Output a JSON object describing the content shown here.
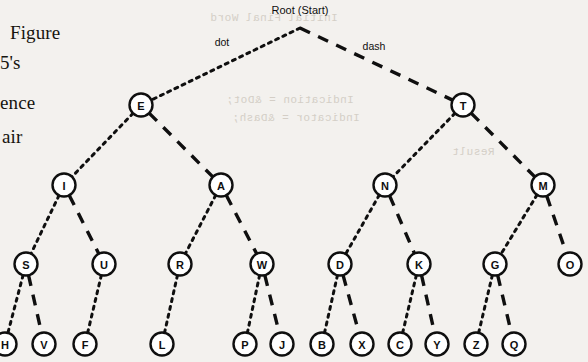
{
  "page": {
    "background": "#f3f1ee",
    "ink": "#0f0f0f",
    "ghost_ink": "#cfc9c0",
    "width": 588,
    "height": 362
  },
  "body_text_column": {
    "lines": [
      "Figure",
      "5's",
      "ence",
      "air"
    ],
    "note_clipped": "left column of page text, cropped by image edge"
  },
  "ghost_text": {
    "lines": [
      "Initial Final Word",
      "Indication = &Dot;",
      "Indicator = &Dash;",
      "Result"
    ]
  },
  "diagram": {
    "title": "Root (Start)",
    "edge_labels": {
      "left": "dot",
      "right": "dash"
    },
    "legend": {
      "dot_style": "dotted",
      "dash_style": "dashed",
      "dot_side": "left",
      "dash_side": "right"
    },
    "root": {
      "x": 300,
      "y": 28
    },
    "node_radius": 11.5,
    "nodes": [
      {
        "id": "E",
        "label": "E",
        "x": 141,
        "y": 105,
        "level": 1,
        "parent": "ROOT",
        "branch": "dot"
      },
      {
        "id": "T",
        "label": "T",
        "x": 463,
        "y": 105,
        "level": 1,
        "parent": "ROOT",
        "branch": "dash"
      },
      {
        "id": "I",
        "label": "I",
        "x": 64,
        "y": 185,
        "level": 2,
        "parent": "E",
        "branch": "dot"
      },
      {
        "id": "A",
        "label": "A",
        "x": 221,
        "y": 185,
        "level": 2,
        "parent": "E",
        "branch": "dash"
      },
      {
        "id": "N",
        "label": "N",
        "x": 385,
        "y": 185,
        "level": 2,
        "parent": "T",
        "branch": "dot"
      },
      {
        "id": "M",
        "label": "M",
        "x": 543,
        "y": 185,
        "level": 2,
        "parent": "T",
        "branch": "dash"
      },
      {
        "id": "S",
        "label": "S",
        "x": 26,
        "y": 264,
        "level": 3,
        "parent": "I",
        "branch": "dot"
      },
      {
        "id": "U",
        "label": "U",
        "x": 104,
        "y": 264,
        "level": 3,
        "parent": "I",
        "branch": "dash"
      },
      {
        "id": "R",
        "label": "R",
        "x": 180,
        "y": 264,
        "level": 3,
        "parent": "A",
        "branch": "dot"
      },
      {
        "id": "W",
        "label": "W",
        "x": 262,
        "y": 264,
        "level": 3,
        "parent": "A",
        "branch": "dash"
      },
      {
        "id": "D",
        "label": "D",
        "x": 340,
        "y": 264,
        "level": 3,
        "parent": "N",
        "branch": "dot"
      },
      {
        "id": "K",
        "label": "K",
        "x": 419,
        "y": 264,
        "level": 3,
        "parent": "N",
        "branch": "dash"
      },
      {
        "id": "G",
        "label": "G",
        "x": 495,
        "y": 264,
        "level": 3,
        "parent": "M",
        "branch": "dot"
      },
      {
        "id": "O",
        "label": "O",
        "x": 570,
        "y": 264,
        "level": 3,
        "parent": "M",
        "branch": "dash"
      },
      {
        "id": "H",
        "label": "H",
        "x": 5,
        "y": 344,
        "level": 4,
        "parent": "S",
        "branch": "dot"
      },
      {
        "id": "V",
        "label": "V",
        "x": 44,
        "y": 344,
        "level": 4,
        "parent": "S",
        "branch": "dash"
      },
      {
        "id": "F",
        "label": "F",
        "x": 85,
        "y": 344,
        "level": 4,
        "parent": "U",
        "branch": "dot"
      },
      {
        "id": "L",
        "label": "L",
        "x": 162,
        "y": 344,
        "level": 4,
        "parent": "R",
        "branch": "dot"
      },
      {
        "id": "P",
        "label": "P",
        "x": 245,
        "y": 344,
        "level": 4,
        "parent": "W",
        "branch": "dot"
      },
      {
        "id": "J",
        "label": "J",
        "x": 282,
        "y": 344,
        "level": 4,
        "parent": "W",
        "branch": "dash"
      },
      {
        "id": "B",
        "label": "B",
        "x": 322,
        "y": 344,
        "level": 4,
        "parent": "D",
        "branch": "dot"
      },
      {
        "id": "X",
        "label": "X",
        "x": 362,
        "y": 344,
        "level": 4,
        "parent": "D",
        "branch": "dash"
      },
      {
        "id": "C",
        "label": "C",
        "x": 400,
        "y": 344,
        "level": 4,
        "parent": "K",
        "branch": "dot"
      },
      {
        "id": "Y",
        "label": "Y",
        "x": 437,
        "y": 344,
        "level": 4,
        "parent": "K",
        "branch": "dash"
      },
      {
        "id": "Z",
        "label": "Z",
        "x": 476,
        "y": 344,
        "level": 4,
        "parent": "G",
        "branch": "dot"
      },
      {
        "id": "Q",
        "label": "Q",
        "x": 514,
        "y": 344,
        "level": 4,
        "parent": "G",
        "branch": "dash"
      }
    ]
  }
}
